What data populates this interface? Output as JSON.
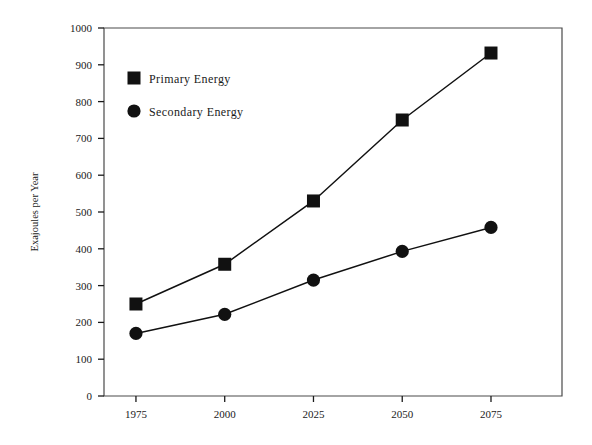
{
  "chart_data": {
    "type": "line",
    "title": "",
    "xlabel": "",
    "ylabel": "Exajoules per Year",
    "x": [
      1975,
      2000,
      2025,
      2050,
      2075
    ],
    "xtick_labels": [
      "1975",
      "2000",
      "2025",
      "2050",
      "2075"
    ],
    "ytick_labels": [
      "0",
      "100",
      "200",
      "300",
      "400",
      "500",
      "600",
      "700",
      "800",
      "900",
      "1000"
    ],
    "yticks": [
      0,
      100,
      200,
      300,
      400,
      500,
      600,
      700,
      800,
      900,
      1000
    ],
    "xlim": [
      1966,
      2095
    ],
    "ylim": [
      0,
      1000
    ],
    "grid": false,
    "legend_position": "upper-left-inside",
    "series": [
      {
        "name": "Primary Energy",
        "marker": "square",
        "color": "#111111",
        "values": [
          250,
          358,
          530,
          750,
          932
        ]
      },
      {
        "name": "Secondary Energy",
        "marker": "circle",
        "color": "#111111",
        "values": [
          170,
          222,
          315,
          393,
          458
        ]
      }
    ]
  },
  "legend": {
    "entries": [
      {
        "label": "Primary Energy",
        "marker": "square"
      },
      {
        "label": "Secondary Energy",
        "marker": "circle"
      }
    ]
  },
  "axis": {
    "y_title": "Exajoules per Year"
  }
}
